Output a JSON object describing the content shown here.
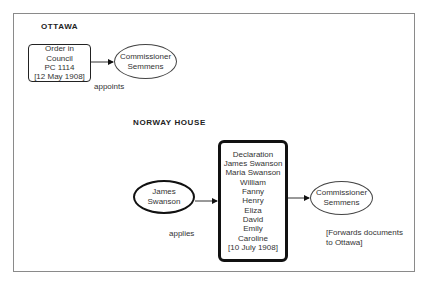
{
  "frame": {
    "border_color": "#8a8a8a"
  },
  "ottawa": {
    "heading": "OTTAWA",
    "order_box": {
      "lines": [
        "Order in",
        "Council",
        "PC 1114",
        "[12 May 1908]"
      ]
    },
    "commissioner": {
      "lines": [
        "Commissioner",
        "Semmens"
      ]
    },
    "edge_label": "appoints"
  },
  "norway_house": {
    "heading": "NORWAY  HOUSE",
    "applicant": {
      "lines": [
        "James",
        "Swanson"
      ]
    },
    "edge_label": "applies",
    "declaration": {
      "lines": [
        "Declaration",
        "James Swanson",
        "Maria Swanson",
        "William",
        "Fanny",
        "Henry",
        "Eliza",
        "David",
        "Emily",
        "Caroline",
        "[10 July 1908]"
      ]
    },
    "commissioner": {
      "lines": [
        "Commissioner",
        "Semmens"
      ]
    },
    "note": {
      "lines": [
        "[Forwards documents",
        "to Ottawa]"
      ]
    }
  }
}
